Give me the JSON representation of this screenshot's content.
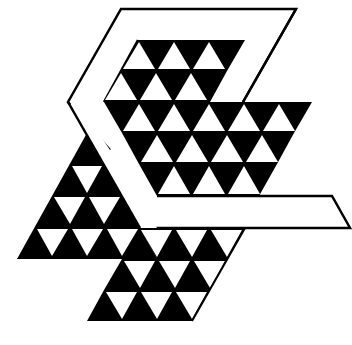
{
  "logo": {
    "name": "triangle-mosaic-emblem",
    "colors": {
      "fill": "#000000",
      "background": "#ffffff"
    },
    "grid": {
      "side": 35,
      "row_height": 31
    },
    "outline_band": {
      "points": "121,9 296,9 243,102 157,102 86,102 68,102 121,9",
      "stroke_width": 2.5
    },
    "shapes": [
      {
        "id": "outer-band",
        "points": "121,9 296,9 245,102 230,102 277,17 127,17 78,102 108,150 100,163 68,102"
      },
      {
        "id": "bar",
        "points": "157,196 333,196 350,228 140,228"
      }
    ]
  }
}
